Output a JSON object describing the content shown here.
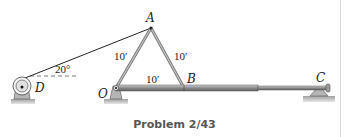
{
  "figure": {
    "caption": "Problem 2/43",
    "points": {
      "A": "A",
      "B": "B",
      "C": "C",
      "D": "D",
      "O": "O"
    },
    "dimensions": {
      "OA": "10′",
      "AB": "10′",
      "OB": "10′"
    },
    "angle_label": "20°",
    "colors": {
      "member": "#a9a9a9",
      "member_dark": "#6e6e6e",
      "support": "#b8b8b8",
      "ground": "#c9c9c9",
      "cable": "#222222"
    }
  }
}
